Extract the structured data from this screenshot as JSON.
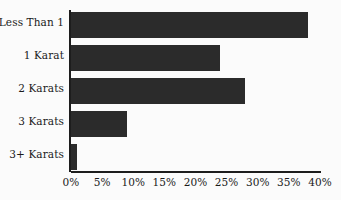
{
  "chart_data": {
    "type": "bar",
    "orientation": "horizontal",
    "title": "",
    "subtitle": "",
    "xlabel": "",
    "ylabel": "",
    "categories": [
      "Less Than 1",
      "1 Karat",
      "2 Karats",
      "3 Karats",
      "3+ Karats"
    ],
    "values": [
      38,
      24,
      28,
      9,
      1
    ],
    "value_unit": "%",
    "xlim": [
      0,
      40
    ],
    "xticks": [
      0,
      5,
      10,
      15,
      20,
      25,
      30,
      35,
      40
    ],
    "xtick_labels": [
      "0%",
      "5%",
      "10%",
      "15%",
      "20%",
      "25%",
      "30%",
      "35%",
      "40%"
    ],
    "grid": false,
    "legend": null,
    "series": [
      {
        "name": "",
        "values": [
          38,
          24,
          28,
          9,
          1
        ]
      }
    ],
    "colors": {
      "bar": "#2b2b2b",
      "axis": "#1d1d1d",
      "text": "#1a1a1a",
      "background": "#fbfbfb"
    }
  },
  "axis": {
    "x_ticks": [
      {
        "label": "0%",
        "value": 0
      },
      {
        "label": "5%",
        "value": 5
      },
      {
        "label": "10%",
        "value": 10
      },
      {
        "label": "15%",
        "value": 15
      },
      {
        "label": "20%",
        "value": 20
      },
      {
        "label": "25%",
        "value": 25
      },
      {
        "label": "30%",
        "value": 30
      },
      {
        "label": "35%",
        "value": 35
      },
      {
        "label": "40%",
        "value": 40
      }
    ]
  },
  "categories": [
    {
      "label": "Less Than 1",
      "value": 38
    },
    {
      "label": "1 Karat",
      "value": 24
    },
    {
      "label": "2 Karats",
      "value": 28
    },
    {
      "label": "3 Karats",
      "value": 9
    },
    {
      "label": "3+ Karats",
      "value": 1
    }
  ]
}
